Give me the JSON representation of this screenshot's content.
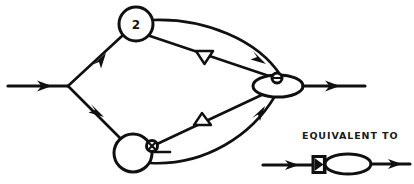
{
  "figure": {
    "background_color": "#ffffff",
    "ink_color": "#101010",
    "width": 414,
    "height": 184
  },
  "nodes": {
    "top_circle": {
      "name": "gain-node-top",
      "label": "2",
      "cx": 136,
      "cy": 24,
      "r": 17
    },
    "bottom_circle": {
      "name": "summing-node-bottom",
      "label": "",
      "cx": 133,
      "cy": 153,
      "r": 19
    },
    "output_ellipse": {
      "name": "output-merge-ellipse",
      "label": "",
      "cx": 278,
      "cy": 86,
      "rx": 25,
      "ry": 11
    },
    "branch_point": {
      "name": "input-branch-point",
      "x": 68,
      "y": 86
    },
    "junction_on_ellipse": {
      "name": "crossed-circle-junction-upper",
      "cx": 277,
      "cy": 78,
      "r": 5
    },
    "junction_on_bottom_circle": {
      "name": "crossed-circle-junction-lower",
      "cx": 152,
      "cy": 146,
      "r": 5
    }
  },
  "markers": {
    "triangle_upper": {
      "name": "triangle-marker-down",
      "orientation": "down",
      "x": 204,
      "y": 57
    },
    "triangle_lower": {
      "name": "triangle-marker-up",
      "orientation": "up",
      "x": 202,
      "y": 120
    }
  },
  "edges": [
    {
      "name": "input-edge",
      "from": "input",
      "to": "branch_point",
      "style": "straight",
      "arrow": true
    },
    {
      "name": "branch-to-top-circle",
      "from": "branch_point",
      "to": "top_circle",
      "style": "straight",
      "arrow": true
    },
    {
      "name": "branch-to-bottom-circle",
      "from": "branch_point",
      "to": "bottom_circle",
      "style": "straight",
      "arrow": true
    },
    {
      "name": "top-circle-curved-to-ellipse",
      "from": "top_circle",
      "to": "output_ellipse",
      "style": "curved",
      "arrow": true
    },
    {
      "name": "top-circle-straight-to-junction",
      "from": "top_circle",
      "to": "junction_on_ellipse",
      "style": "straight",
      "arrow": false,
      "marker": "triangle_upper"
    },
    {
      "name": "bottom-circle-curved-to-ellipse",
      "from": "bottom_circle",
      "to": "output_ellipse",
      "style": "curved",
      "arrow": true
    },
    {
      "name": "bottom-junction-straight-to-ellipse",
      "from": "junction_on_bottom_circle",
      "to": "output_ellipse",
      "style": "straight",
      "arrow": false,
      "marker": "triangle_lower"
    },
    {
      "name": "output-edge",
      "from": "output_ellipse",
      "to": "output",
      "style": "straight",
      "arrow": true
    }
  ],
  "legend": {
    "text": "EQUIVALENT TO",
    "text_x": 302,
    "text_y": 139,
    "inset": {
      "name": "equivalence-inset",
      "input_arrow": {
        "x1": 263,
        "y1": 165,
        "x2": 313,
        "y2": 165
      },
      "gate_box": {
        "x": 313,
        "y": 157,
        "width": 12,
        "height": 16,
        "glyph": "bowtie"
      },
      "ellipse": {
        "cx": 348,
        "cy": 164,
        "rx": 23,
        "ry": 10
      },
      "output_arrow": {
        "x1": 371,
        "y1": 164,
        "x2": 408,
        "y2": 164
      }
    }
  },
  "caption": {
    "name": "figure-caption-cropped",
    "text": "",
    "x": 207,
    "y": 180
  }
}
